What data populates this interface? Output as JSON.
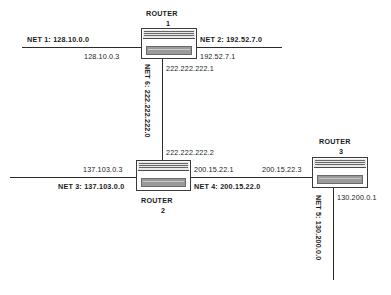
{
  "diagram": {
    "routers": [
      {
        "id": "router1",
        "name": "ROUTER",
        "number": "1"
      },
      {
        "id": "router2",
        "name": "ROUTER",
        "number": "2"
      },
      {
        "id": "router3",
        "name": "ROUTER",
        "number": "3"
      }
    ],
    "networks": [
      {
        "id": "net1",
        "label": "NET  1: 128.10.0.0",
        "orientation": "horizontal"
      },
      {
        "id": "net2",
        "label": "NET  2: 192.52.7.0",
        "orientation": "horizontal"
      },
      {
        "id": "net3",
        "label": "NET 3: 137.103.0.0",
        "orientation": "horizontal"
      },
      {
        "id": "net4",
        "label": "NET 4: 200.15.22.0",
        "orientation": "horizontal"
      },
      {
        "id": "net5",
        "label": "NET 5: 130.200.0.0",
        "orientation": "vertical"
      },
      {
        "id": "net6",
        "label": "NET  6: 222.222.222.0",
        "orientation": "vertical"
      }
    ],
    "interfaces": [
      {
        "id": "if-r1-net1",
        "address": "128.10.0.3"
      },
      {
        "id": "if-r1-net2",
        "address": "192.52.7.1"
      },
      {
        "id": "if-r1-net6",
        "address": "222.222.222.1"
      },
      {
        "id": "if-r2-net6",
        "address": "222.222.222.2"
      },
      {
        "id": "if-r2-net3",
        "address": "137.103.0.3"
      },
      {
        "id": "if-r2-net4",
        "address": "200.15.22.1"
      },
      {
        "id": "if-r3-net4",
        "address": "200.15.22.3"
      },
      {
        "id": "if-r3-net5",
        "address": "130.200.0.1"
      }
    ],
    "colors": {
      "line": "#2b2b2b",
      "text": "#1a1a1a",
      "chassis_fill": "#ffffff",
      "chassis_bar": "#9a9a9a",
      "background": "#ffffff"
    }
  }
}
